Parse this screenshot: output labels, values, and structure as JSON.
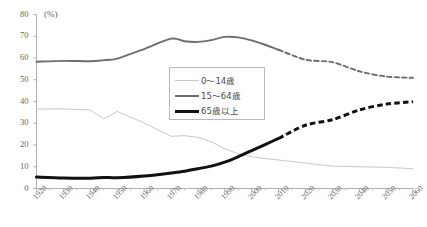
{
  "axes": {
    "unit_label": "(%)",
    "y_ticks": [
      "0",
      "10",
      "20",
      "30",
      "40",
      "50",
      "60",
      "70",
      "80"
    ],
    "x_ticks": [
      "1920",
      "1930",
      "1940",
      "1950",
      "1960",
      "1970",
      "1980",
      "1990",
      "2000",
      "2010",
      "2020",
      "2030",
      "2040",
      "2050",
      "2060"
    ]
  },
  "legend": {
    "items": [
      {
        "label": "0～14歳",
        "color": "#c8c8c8",
        "width": 1
      },
      {
        "label": "15～64歳",
        "color": "#6e6e6e",
        "width": 2
      },
      {
        "label": "65歳以上",
        "color": "#111111",
        "width": 3.2
      }
    ]
  },
  "chart_data": {
    "type": "line",
    "title": "",
    "xlabel": "",
    "ylabel": "(%)",
    "xlim": [
      1920,
      2060
    ],
    "ylim": [
      0,
      80
    ],
    "grid": false,
    "legend_position": "center",
    "projection_start_year": 2010,
    "x": [
      1920,
      1930,
      1940,
      1945,
      1950,
      1960,
      1970,
      1975,
      1980,
      1985,
      1990,
      1995,
      2000,
      2005,
      2010,
      2020,
      2030,
      2040,
      2050,
      2060
    ],
    "series": [
      {
        "name": "0～14歳",
        "color": "#c8c8c8",
        "width": 1,
        "values": [
          36.5,
          36.6,
          36.1,
          32.0,
          35.4,
          30.2,
          24.0,
          24.3,
          23.5,
          21.5,
          18.2,
          16.0,
          14.6,
          13.8,
          13.1,
          11.7,
          10.3,
          10.0,
          9.7,
          9.1
        ]
      },
      {
        "name": "15～64歳",
        "color": "#6e6e6e",
        "width": 1.9,
        "values": [
          58.3,
          58.7,
          58.5,
          59.0,
          59.7,
          64.1,
          68.9,
          67.7,
          67.4,
          68.2,
          69.7,
          69.5,
          68.1,
          66.1,
          63.8,
          59.2,
          58.1,
          53.9,
          51.5,
          50.9
        ]
      },
      {
        "name": "65歳以上",
        "color": "#111111",
        "width": 3.0,
        "values": [
          5.3,
          4.8,
          4.7,
          5.1,
          4.9,
          5.7,
          7.1,
          7.9,
          9.1,
          10.3,
          12.1,
          14.6,
          17.4,
          20.2,
          23.0,
          29.1,
          31.6,
          36.1,
          38.8,
          39.9
        ]
      }
    ]
  }
}
